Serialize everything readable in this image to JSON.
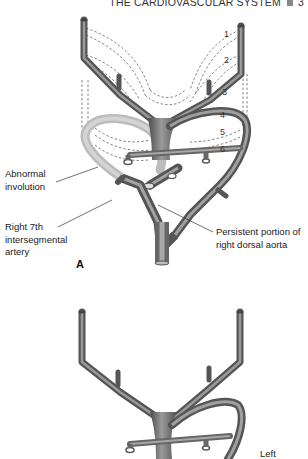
{
  "header": {
    "running_title": "THE CARDIOVASCULAR SYSTEM",
    "page_number": "3"
  },
  "figure_a": {
    "panel_letter": "A",
    "arch_numbers": [
      "1",
      "2",
      "3",
      "4",
      "5",
      "6"
    ],
    "labels": {
      "abnormal_involution": "Abnormal\ninvolution",
      "right_7th": "Right 7th\nintersegmental\nartery",
      "persistent": "Persistent portion of\nright dorsal aorta"
    }
  },
  "figure_b": {
    "labels": {
      "left": "Left"
    }
  },
  "colors": {
    "vessel_dark": "#5a5a5a",
    "vessel_mid": "#8a8a8a",
    "vessel_light": "#b8b8b8",
    "involuted_vessel": "#c9c9c9",
    "dashed_lines": "#666666",
    "leader_lines": "#333333"
  }
}
